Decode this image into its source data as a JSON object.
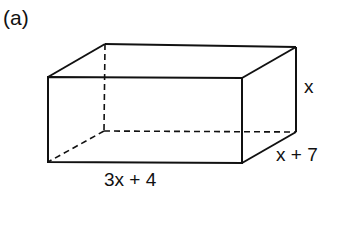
{
  "figure": {
    "part_label": "(a)",
    "shape": "rectangular-prism",
    "dimensions": {
      "height": "x",
      "depth": "x + 7",
      "width": "3x + 4"
    },
    "colors": {
      "stroke": "#111111",
      "background": "#ffffff"
    }
  }
}
